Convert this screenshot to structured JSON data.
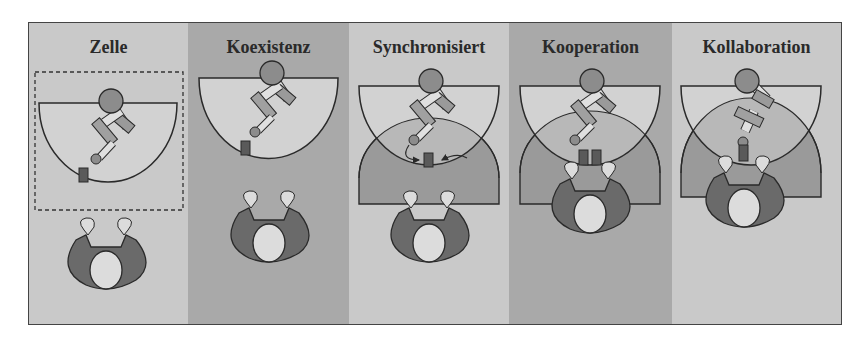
{
  "figure": {
    "columns": [
      {
        "id": "zelle",
        "title": "Zelle",
        "bg": "#c9c9c9"
      },
      {
        "id": "koexistenz",
        "title": "Koexistenz",
        "bg": "#a9a9a9"
      },
      {
        "id": "synchronisiert",
        "title": "Synchronisiert",
        "bg": "#c9c9c9"
      },
      {
        "id": "kooperation",
        "title": "Kooperation",
        "bg": "#a9a9a9"
      },
      {
        "id": "kollaboration",
        "title": "Kollaboration",
        "bg": "#c9c9c9"
      }
    ],
    "colors": {
      "robot_zone_fill": "#d2d2d2",
      "human_zone_fill": "#9a9a9a",
      "overlap_fill": "#b8b8b8",
      "robot_base": "#8c8c8c",
      "robot_link": "#a0a0a0",
      "part": "#5a5a5a",
      "human_body": "#6a6a6a",
      "human_head": "#dcdcdc",
      "outline": "#2a2a2a"
    }
  }
}
